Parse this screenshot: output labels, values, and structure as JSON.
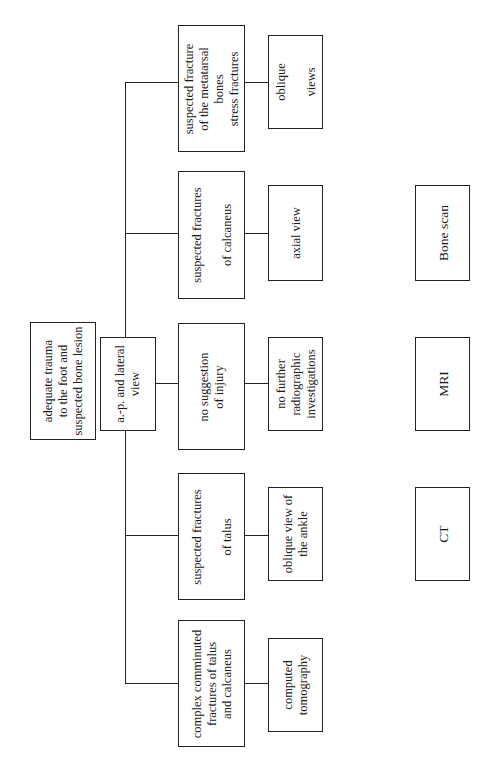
{
  "diagram": {
    "type": "flowchart",
    "orientation": "rotated-90-ccw",
    "root": {
      "id": "root",
      "text": "adequate trauma\nto the foot and\nsuspected bone lesion"
    },
    "initial_step": {
      "id": "ap-lateral",
      "text": "a.-p. and lateral\nview"
    },
    "branches": [
      {
        "id": "metatarsal",
        "finding": "suspected fracture\nof the metatarsal\nbones\nstress fractures",
        "action": "oblique\n\nviews"
      },
      {
        "id": "calcaneus",
        "finding": "suspected fractures\n\nof calcaneus",
        "action": "axial view"
      },
      {
        "id": "no-injury",
        "finding": "no suggestion\nof injury",
        "action": "no further\nradiographic\ninvestigations"
      },
      {
        "id": "talus",
        "finding": "suspected fractures\n\nof talus",
        "action": "oblique view of\nthe ankle"
      },
      {
        "id": "complex",
        "finding": "complex comminuted\nfractures of talus\nand calcaneus",
        "action": "computed\ntomography"
      }
    ],
    "additional_modalities": [
      {
        "id": "bone-scan",
        "text": "Bone scan"
      },
      {
        "id": "mri",
        "text": "MRI"
      },
      {
        "id": "ct",
        "text": "CT"
      }
    ]
  }
}
